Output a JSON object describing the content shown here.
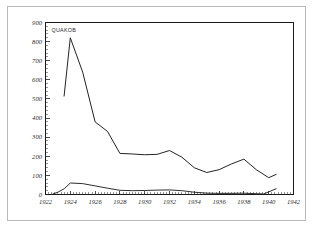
{
  "page": {
    "background_color": "#ffffff",
    "border_color": "#b9b9b9"
  },
  "legend": {
    "label": "QUAKOB",
    "position": "top-left-inside"
  },
  "chart_data": {
    "type": "line",
    "title": "",
    "subtitle": "",
    "xlabel": "",
    "ylabel": "",
    "xlim": [
      1922,
      1942
    ],
    "ylim": [
      0,
      900
    ],
    "grid": false,
    "legend_position": "top-left-inside",
    "line_color": "#242424",
    "xticks": [
      1922,
      1924,
      1926,
      1928,
      1930,
      1932,
      1934,
      1936,
      1938,
      1940,
      1942
    ],
    "xtick_labels": [
      "1922",
      "1924",
      "1926",
      "1928",
      "1930",
      "1932",
      "1934",
      "1936",
      "1938",
      "1940",
      "1942"
    ],
    "xtick_step": 2,
    "x_minor_step": 0.25,
    "yticks": [
      0,
      100,
      200,
      300,
      400,
      500,
      600,
      700,
      800,
      900
    ],
    "ytick_labels": [
      "0",
      "100",
      "200",
      "300",
      "400",
      "500",
      "600",
      "700",
      "800",
      "900"
    ],
    "ytick_step": 100,
    "y_minor_step": 20,
    "series": [
      {
        "name": "QUAKOB",
        "x": [
          1923.5,
          1924.0,
          1925.0,
          1926.0,
          1927.0,
          1928.0,
          1929.0,
          1930.0,
          1931.0,
          1932.0,
          1933.0,
          1934.0,
          1935.0,
          1936.0,
          1937.0,
          1938.0,
          1939.0,
          1940.0,
          1940.6
        ],
        "values": [
          515,
          820,
          640,
          380,
          330,
          215,
          212,
          208,
          210,
          230,
          195,
          140,
          115,
          130,
          160,
          185,
          130,
          88,
          105
        ]
      },
      {
        "name": "secondary",
        "x": [
          1922.6,
          1923.0,
          1923.5,
          1924.0,
          1925.0,
          1926.0,
          1927.0,
          1928.0,
          1929.0,
          1930.0,
          1931.0,
          1932.0,
          1933.0,
          1934.0,
          1935.0,
          1936.0,
          1937.0,
          1938.0,
          1939.0,
          1939.6,
          1940.6
        ],
        "values": [
          3,
          12,
          30,
          60,
          57,
          45,
          33,
          22,
          20,
          21,
          23,
          24,
          20,
          12,
          7,
          6,
          6,
          7,
          4,
          3,
          30
        ]
      }
    ]
  }
}
